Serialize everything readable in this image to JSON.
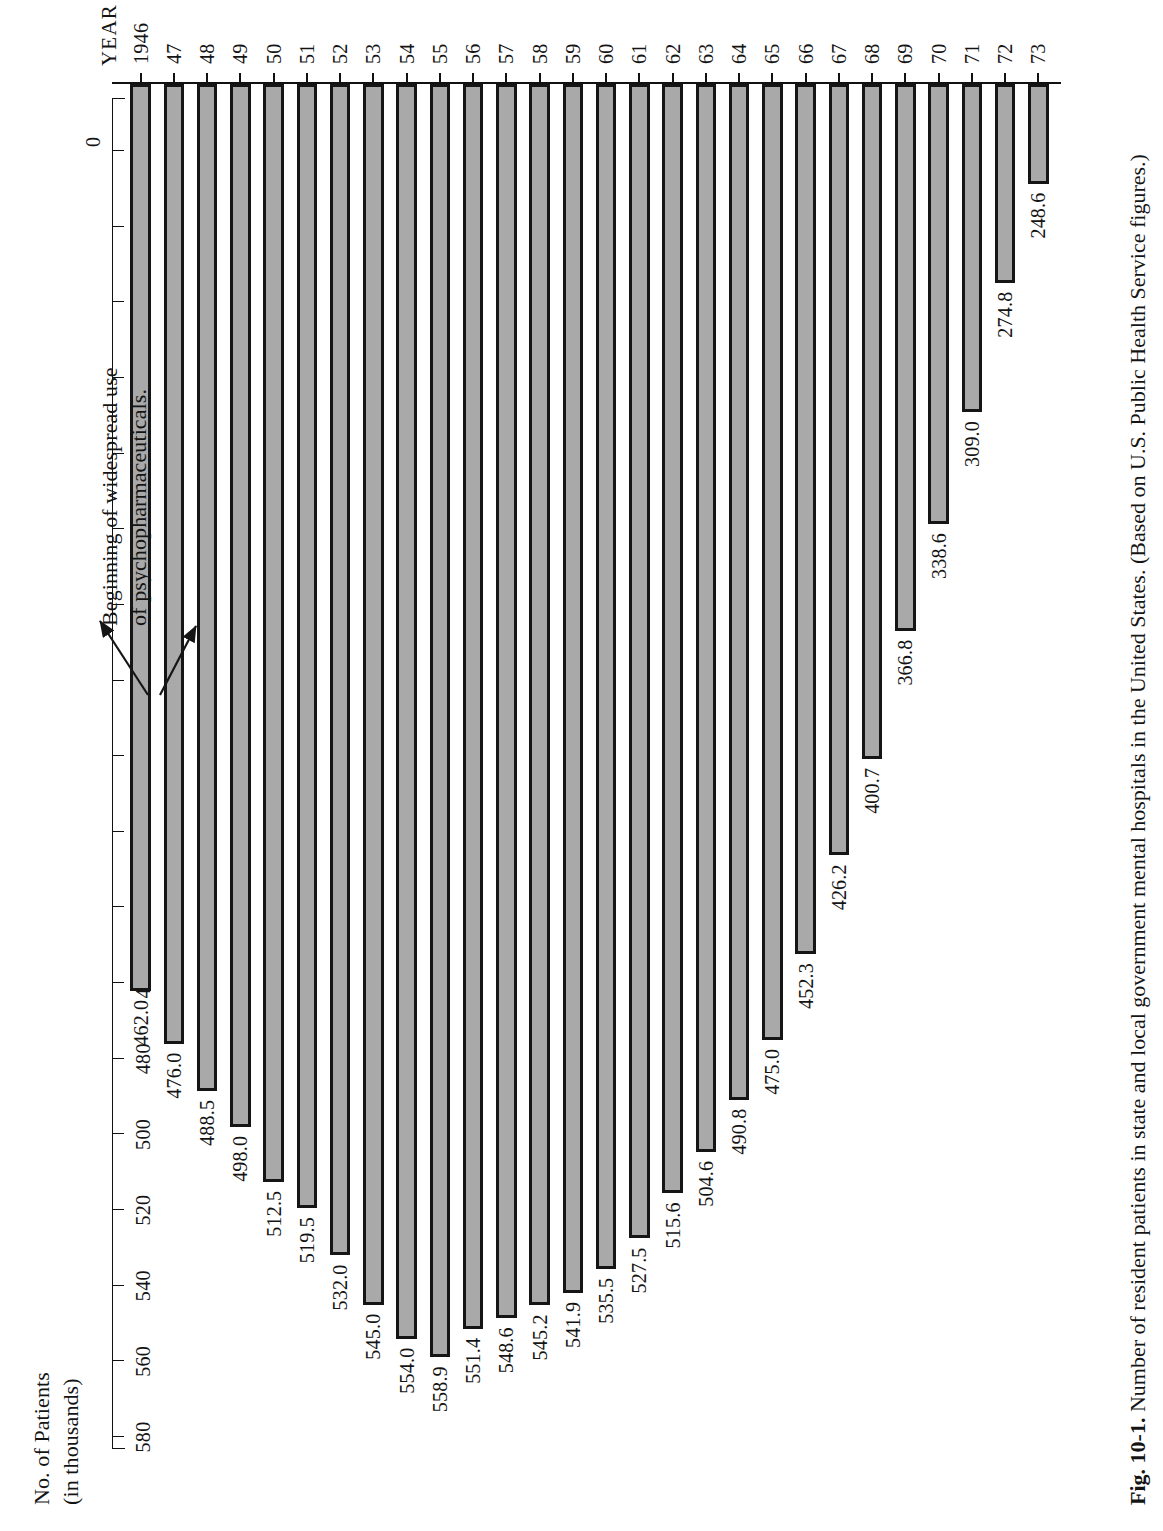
{
  "figure": {
    "axis_title_line1": "No. of Patients",
    "axis_title_line2": "(in thousands)",
    "year_axis_name": "YEAR",
    "zero_label": "0",
    "caption_bold": "Fig. 10-1.",
    "caption_rest": " Number of resident patients in state and local government mental hospitals in the United States. (Based on U.S. Public Health Service figures.)",
    "annotation_line1": "Beginning of widespread use",
    "annotation_line2": "of psychopharmaceuticals."
  },
  "chart_data": {
    "type": "bar",
    "orientation": "horizontal-rotated",
    "title": "Number of resident patients in state and local government mental hospitals in the United States",
    "xlabel": "YEAR",
    "ylabel": "No. of Patients (in thousands)",
    "ylim": [
      240,
      580
    ],
    "grid": false,
    "legend": "none",
    "value_ticks": [
      580,
      560,
      540,
      520,
      500,
      480,
      460,
      440,
      420,
      400,
      380,
      360,
      340,
      320,
      300,
      280,
      260,
      240
    ],
    "categories": [
      "1946",
      "47",
      "48",
      "49",
      "50",
      "51",
      "52",
      "53",
      "54",
      "55",
      "56",
      "57",
      "58",
      "59",
      "60",
      "61",
      "62",
      "63",
      "64",
      "65",
      "66",
      "67",
      "68",
      "69",
      "70",
      "71",
      "72",
      "73"
    ],
    "values": [
      462.0,
      476.0,
      488.5,
      498.0,
      512.5,
      519.5,
      532.0,
      545.0,
      554.0,
      558.9,
      551.4,
      548.6,
      545.2,
      541.9,
      535.5,
      527.5,
      515.6,
      504.6,
      490.8,
      475.0,
      452.3,
      426.2,
      400.7,
      366.8,
      338.6,
      309.0,
      274.8,
      248.6
    ],
    "value_labels": [
      "462.0",
      "476.0",
      "488.5",
      "498.0",
      "512.5",
      "519.5",
      "532.0",
      "545.0",
      "554.0",
      "558.9",
      "551.4",
      "548.6",
      "545.2",
      "541.9",
      "535.5",
      "527.5",
      "515.6",
      "504.6",
      "490.8",
      "475.0",
      "452.3",
      "426.2",
      "400.7",
      "366.8",
      "338.6",
      "309.0",
      "274.8",
      "248.6"
    ],
    "annotations": [
      {
        "text": "Beginning of widespread use of psychopharmaceuticals.",
        "points_to": [
          "1955",
          "1956"
        ]
      }
    ]
  }
}
